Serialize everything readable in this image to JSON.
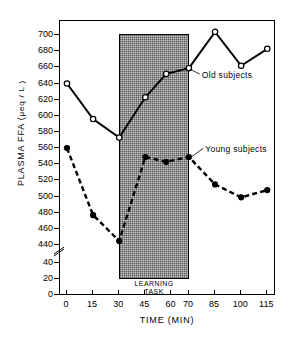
{
  "chart_data": {
    "type": "line",
    "title": "",
    "xlabel": "TIME  (MIN)",
    "ylabel": "PLASMA  FFA  ( μeq / L )",
    "ylabel_main": "PLASMA  FFA  (",
    "ylabel_units": "μeq / L )",
    "x": [
      0,
      15,
      30,
      45,
      57,
      70,
      85,
      100,
      115
    ],
    "xlim": [
      -4,
      120
    ],
    "xticks": [
      0,
      15,
      30,
      45,
      60,
      70,
      85,
      100,
      115
    ],
    "xticklabels": [
      "0",
      "15",
      "30",
      "45",
      "60",
      "70",
      "85",
      "100",
      "115"
    ],
    "yticks_upper": [
      440,
      460,
      480,
      500,
      520,
      540,
      560,
      580,
      600,
      620,
      640,
      660,
      680,
      700
    ],
    "yticklabels_upper": [
      "440",
      "460",
      "480",
      "500",
      "520",
      "540",
      "560",
      "580",
      "600",
      "620",
      "640",
      "660",
      "680",
      "700"
    ],
    "yticks_lower": [
      0,
      20,
      40
    ],
    "yticklabels_lower": [
      "0",
      "20",
      "40"
    ],
    "axis_break": true,
    "axis_break_between": [
      40,
      440
    ],
    "ylim_upper": [
      440,
      710
    ],
    "ylim_lower": [
      0,
      45
    ],
    "grid": false,
    "legend_position": "inline-annotation",
    "series": [
      {
        "name": "Old subjects",
        "marker": "open-circle",
        "linestyle": "solid",
        "color": "#000000",
        "x": [
          0,
          15,
          30,
          45,
          57,
          70,
          85,
          100,
          115
        ],
        "values": [
          640,
          596,
          573,
          623,
          652,
          659,
          704,
          662,
          683
        ]
      },
      {
        "name": "Young subjects",
        "marker": "filled-circle",
        "linestyle": "dashed",
        "color": "#000000",
        "x": [
          0,
          15,
          30,
          45,
          57,
          70,
          85,
          100,
          115
        ],
        "values": [
          560,
          477,
          445,
          549,
          543,
          549,
          515,
          499,
          508
        ]
      }
    ],
    "annotations": [
      {
        "text": "Old subjects",
        "x": 78,
        "y": 648
      },
      {
        "text": "Young subjects",
        "x": 80,
        "y": 556
      }
    ],
    "shaded_region": {
      "label_line1": "LEARNING",
      "label_line2": "TASK",
      "x_start": 30,
      "x_end": 70,
      "y_top": 701,
      "y_bottom": 20
    }
  }
}
